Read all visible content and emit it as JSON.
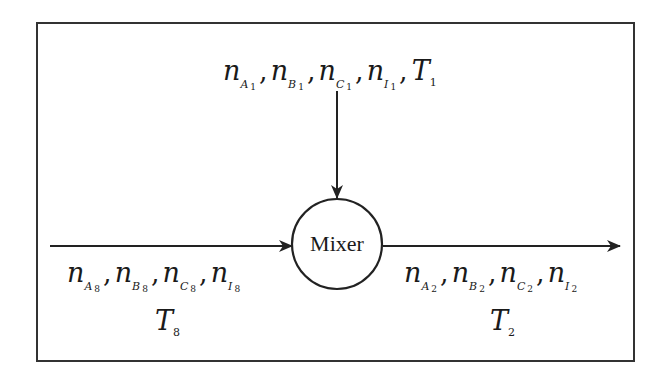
{
  "diagram": {
    "type": "process-flow",
    "unit": {
      "label": "Mixer",
      "shape": "circle"
    },
    "streams": [
      {
        "id": "stream-1",
        "direction": "input-top",
        "variables": [
          {
            "symbol": "n",
            "species": "A",
            "index": "1"
          },
          {
            "symbol": "n",
            "species": "B",
            "index": "1"
          },
          {
            "symbol": "n",
            "species": "C",
            "index": "1"
          },
          {
            "symbol": "n",
            "species": "I",
            "index": "1"
          }
        ],
        "temperature": {
          "symbol": "T",
          "index": "1"
        }
      },
      {
        "id": "stream-8",
        "direction": "input-left",
        "variables": [
          {
            "symbol": "n",
            "species": "A",
            "index": "8"
          },
          {
            "symbol": "n",
            "species": "B",
            "index": "8"
          },
          {
            "symbol": "n",
            "species": "C",
            "index": "8"
          },
          {
            "symbol": "n",
            "species": "I",
            "index": "8"
          }
        ],
        "temperature": {
          "symbol": "T",
          "index": "8"
        }
      },
      {
        "id": "stream-2",
        "direction": "output-right",
        "variables": [
          {
            "symbol": "n",
            "species": "A",
            "index": "2"
          },
          {
            "symbol": "n",
            "species": "B",
            "index": "2"
          },
          {
            "symbol": "n",
            "species": "C",
            "index": "2"
          },
          {
            "symbol": "n",
            "species": "I",
            "index": "2"
          }
        ],
        "temperature": {
          "symbol": "T",
          "index": "2"
        }
      }
    ],
    "separator": ","
  }
}
